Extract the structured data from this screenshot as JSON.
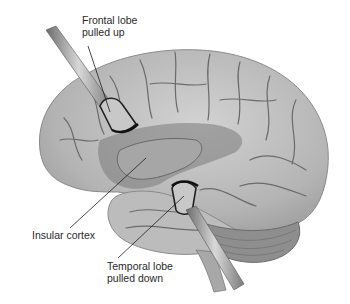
{
  "figure": {
    "palette": {
      "background": "#ffffff",
      "brain_fill": "#b8b8b8",
      "brain_light": "#d4d4d4",
      "sulcus": "#6a6a6a",
      "shadow": "#4a4a4a",
      "cerebellum": "#8e8e8e",
      "retractor": "#9a9a9a",
      "retractor_edge": "#222222",
      "label_text": "#2a2a2a",
      "leader_line": "#1e1e1e"
    },
    "labels": {
      "frontal": {
        "line1": "Frontal lobe",
        "line2": "pulled up"
      },
      "insular": {
        "line1": "Insular cortex"
      },
      "temporal": {
        "line1": "Temporal lobe",
        "line2": "pulled down"
      }
    }
  }
}
